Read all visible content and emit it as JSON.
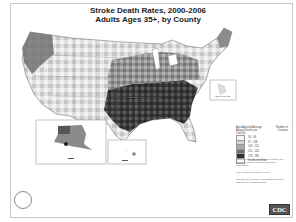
{
  "title": {
    "line1": "Stroke Death Rates, 2000-2006",
    "line2": "Adults Ages 35+, by County"
  },
  "colors": {
    "class1": "#f4f4f4",
    "class2": "#d2d2d2",
    "class3": "#a8a8a8",
    "class4": "#6e6e6e",
    "class5": "#2e2e2e",
    "insufficient": "#fafafa",
    "border": "#777777"
  },
  "legend": {
    "header_left": "Age-Adjusted Average Annual Deaths per 100,000",
    "header_right": "Number of Counties",
    "classes": [
      {
        "range": "59 - 96",
        "count": "",
        "color": "#f4f4f4"
      },
      {
        "range": "97 - 108",
        "count": "",
        "color": "#d2d2d2"
      },
      {
        "range": "109 - 114",
        "count": "",
        "color": "#a8a8a8"
      },
      {
        "range": "115 - 126",
        "count": "",
        "color": "#6e6e6e"
      },
      {
        "range": "129 - 385",
        "count": "",
        "color": "#2e2e2e"
      },
      {
        "range": "Insufficient Data",
        "count": "",
        "color": "#fafafa"
      }
    ]
  },
  "notes": {
    "note1": "Rates are spatially smoothed to enhance the stability of rates in counties with small populations.",
    "note2": "ICD-10 codes for stroke: I60-I69",
    "note3": "Data Source: National Vital Statistics System and the U.S. Census Bureau"
  },
  "insets": {
    "new_york_city": "New York City",
    "alaska": "Alaska",
    "hawaii": "Hawaii"
  },
  "logos": {
    "cdc": "CDC"
  }
}
